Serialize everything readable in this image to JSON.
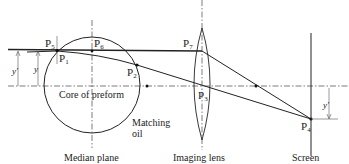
{
  "diagram": {
    "points": [
      {
        "id": "P1",
        "label": "P",
        "sub": "1"
      },
      {
        "id": "P2",
        "label": "P",
        "sub": "2"
      },
      {
        "id": "P3",
        "label": "P",
        "sub": "3"
      },
      {
        "id": "P4",
        "label": "P",
        "sub": "4"
      },
      {
        "id": "P5",
        "label": "P",
        "sub": "5"
      },
      {
        "id": "P6",
        "label": "P",
        "sub": "6"
      },
      {
        "id": "P7",
        "label": "P",
        "sub": "7"
      }
    ],
    "labels": {
      "core": "Core of preform",
      "matching_oil_1": "Matching",
      "matching_oil_2": "oil",
      "median_plane": "Median plane",
      "imaging_lens": "Imaging lens",
      "screen": "Screen"
    },
    "dimensions": {
      "y_prime_left": "y'",
      "y_left": "y",
      "y_prime_right": "y'"
    }
  }
}
